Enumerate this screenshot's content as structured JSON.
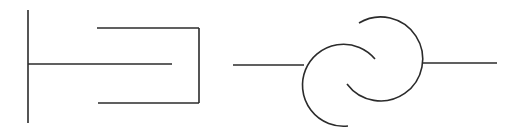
{
  "diagram": {
    "title": "",
    "stroke_color": "#2b2b2b",
    "stroke_width": 1.6,
    "symbols": [
      {
        "name": "capacitor-symbol",
        "description": "Vertical bar with horizontal lead into open rectangular bracket",
        "parts": {
          "vertical_bar": {
            "x": 28,
            "y1": 10,
            "y2": 123
          },
          "lead": {
            "y": 64,
            "x1": 28,
            "x2": 172
          },
          "bracket_top": {
            "y": 28,
            "x1": 97,
            "x2": 199
          },
          "bracket_right": {
            "x": 199,
            "y1": 28,
            "y2": 103
          },
          "bracket_bottom": {
            "y": 103,
            "x1": 98,
            "x2": 199
          }
        }
      },
      {
        "name": "interlocking-arcs-symbol",
        "description": "Two interlocking open circles with leads on either side",
        "parts": {
          "left_lead": {
            "y": 65,
            "x1": 233,
            "x2": 305
          },
          "left_arc": {
            "cx": 344,
            "cy": 85,
            "r": 41
          },
          "right_arc": {
            "cx": 380,
            "cy": 59,
            "r": 42
          },
          "right_lead": {
            "y": 63,
            "x1": 422,
            "x2": 497
          }
        }
      }
    ]
  }
}
